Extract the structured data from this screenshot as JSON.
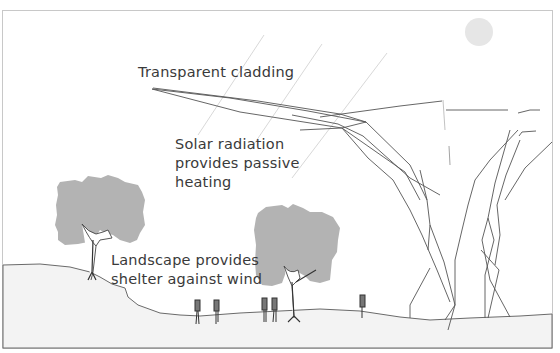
{
  "diagram": {
    "title": "",
    "labels": {
      "cladding": "Transparent cladding",
      "solar_line1": "Solar radiation",
      "solar_line2": "provides passive",
      "solar_line3": "heating",
      "landscape_line1": "Landscape provides",
      "landscape_line2": "shelter against wind"
    },
    "elements": {
      "sun": "sun-circle",
      "rays": "solar-ray-lines",
      "canopy": "tree-like-canopy-structure",
      "trees": [
        "tree-left",
        "tree-center"
      ],
      "people": [
        "person-1",
        "person-2",
        "person-3",
        "person-4",
        "person-5",
        "person-6"
      ],
      "ground": "ground-terrain"
    },
    "colors": {
      "frame": "#c8c8c8",
      "ground_fill": "#f3f3f3",
      "tree_fill": "#b3b3b3",
      "sun_fill": "#e6e6e6",
      "line": "#555555",
      "ray": "#d8d8d8",
      "text": "#3a3a3a"
    }
  }
}
